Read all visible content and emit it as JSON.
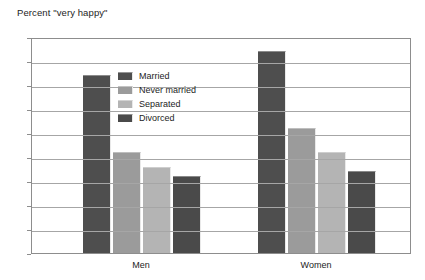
{
  "chart_data": {
    "type": "bar",
    "title": "Percent \"very happy\"",
    "xlabel": "",
    "ylabel": "",
    "ylim": [
      0,
      45
    ],
    "ytick_step": 5,
    "yticks": [
      "0",
      "5",
      "10",
      "15",
      "20",
      "25",
      "30",
      "35",
      "40",
      "45"
    ],
    "grid": true,
    "legend_position": "inside-upper-left",
    "categories": [
      "Men",
      "Women"
    ],
    "series": [
      {
        "name": "Married",
        "values": [
          37,
          42
        ],
        "color": "#4e4e4e"
      },
      {
        "name": "Never married",
        "values": [
          21,
          26
        ],
        "color": "#9b9b9b"
      },
      {
        "name": "Separated",
        "values": [
          18,
          21
        ],
        "color": "#b4b4b4"
      },
      {
        "name": "Divorced",
        "values": [
          16,
          17
        ],
        "color": "#4a4a4a"
      }
    ]
  },
  "axis": {
    "y_min": 0,
    "y_max": 45
  },
  "colors": {
    "frame": "#8d8d8d",
    "gridline": "#a6a6a6",
    "text": "#1d1d1d",
    "background": "#ffffff"
  }
}
